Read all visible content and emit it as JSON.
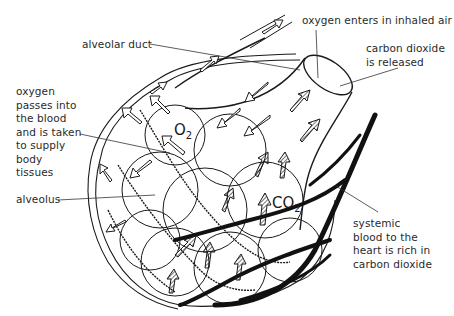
{
  "diagram": {
    "type": "anatomical-illustration",
    "labels": {
      "oxygen_enters": "oxygen enters in inhaled air",
      "co2_released_line1": "carbon dioxide",
      "co2_released_line2": "is released",
      "alveolar_duct": "alveolar duct",
      "oxygen_passes": [
        "oxygen",
        "passes into",
        "the blood",
        "and is taken",
        "to supply",
        "body",
        "tissues"
      ],
      "alveolus": "alveolus",
      "systemic_blood": [
        "systemic",
        "blood to the",
        "heart is rich in",
        "carbon dioxide"
      ]
    },
    "chemicals": {
      "o2": {
        "symbol": "O",
        "subscript": "2"
      },
      "co2": {
        "symbol": "CO",
        "subscript": "2"
      }
    },
    "colors": {
      "ink": "#1a1a1a",
      "background": "#ffffff",
      "text": "#2a2a2a"
    }
  }
}
